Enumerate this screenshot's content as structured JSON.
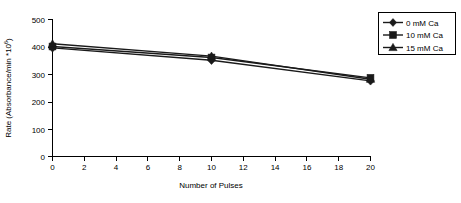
{
  "chart_data": {
    "type": "line",
    "title": "",
    "xlabel": "Number of Pulses",
    "ylabel": "Rate (Absorbance/min *106)",
    "ylabel_main": "Rate (Absorbance/min *10",
    "ylabel_sup": "6",
    "ylabel_close": ")",
    "x": [
      0,
      10,
      20
    ],
    "xlim": [
      0,
      20
    ],
    "ylim": [
      0,
      500
    ],
    "xticks": [
      0,
      2,
      4,
      6,
      8,
      10,
      12,
      14,
      16,
      18,
      20
    ],
    "xtick_labels": [
      "0",
      "2",
      "4",
      "6",
      "8",
      "10",
      "12",
      "14",
      "16",
      "18",
      "20"
    ],
    "yticks": [
      0,
      100,
      200,
      300,
      400,
      500
    ],
    "ytick_labels": [
      "0",
      "100",
      "200",
      "300",
      "400",
      "500"
    ],
    "grid": false,
    "legend_position": "top-right",
    "series": [
      {
        "name": "0 mM Ca",
        "marker": "diamond",
        "color": "#1a1a1a",
        "values": [
          395,
          350,
          275
        ]
      },
      {
        "name": "10 mM Ca",
        "marker": "square",
        "color": "#1a1a1a",
        "values": [
          400,
          360,
          286
        ]
      },
      {
        "name": "15 mM Ca",
        "marker": "triangle",
        "color": "#1a1a1a",
        "values": [
          410,
          365,
          281
        ]
      }
    ]
  },
  "legend": {
    "items": [
      {
        "label": "0 mM Ca",
        "marker": "diamond-marker-icon"
      },
      {
        "label": "10 mM Ca",
        "marker": "square-marker-icon"
      },
      {
        "label": "15 mM Ca",
        "marker": "triangle-marker-icon"
      }
    ]
  }
}
